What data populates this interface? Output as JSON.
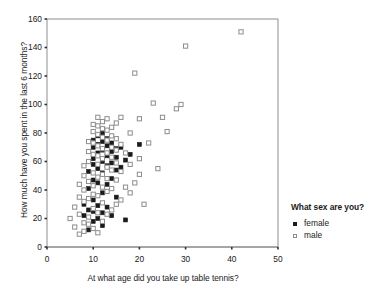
{
  "chart_data": {
    "type": "scatter",
    "title": "",
    "xlabel": "At what age did you take up table tennis?",
    "ylabel": "How much have you spent in the last 6 months?",
    "xlim": [
      0,
      50
    ],
    "ylim": [
      0,
      160
    ],
    "xticks": [
      0,
      10,
      20,
      30,
      40,
      50
    ],
    "yticks": [
      0,
      20,
      40,
      60,
      80,
      100,
      120,
      140,
      160
    ],
    "grid": false,
    "legend": {
      "title": "What sex are you?",
      "position": "right",
      "entries": [
        {
          "label": "female",
          "marker": "filled-square",
          "color": "#1a1a1a"
        },
        {
          "label": "male",
          "marker": "open-square",
          "color": "#8d8d8d"
        }
      ]
    },
    "series": [
      {
        "name": "female",
        "marker": "filled-square",
        "color": "#1a1a1a",
        "points": [
          [
            8,
            22
          ],
          [
            8,
            30
          ],
          [
            9,
            12
          ],
          [
            9,
            26
          ],
          [
            9,
            41
          ],
          [
            9,
            53
          ],
          [
            10,
            18
          ],
          [
            10,
            25
          ],
          [
            10,
            33
          ],
          [
            10,
            47
          ],
          [
            10,
            58
          ],
          [
            10,
            62
          ],
          [
            10,
            70
          ],
          [
            10,
            75
          ],
          [
            11,
            20
          ],
          [
            11,
            29
          ],
          [
            11,
            45
          ],
          [
            11,
            55
          ],
          [
            11,
            66
          ],
          [
            11,
            72
          ],
          [
            11,
            78
          ],
          [
            12,
            15
          ],
          [
            12,
            24
          ],
          [
            12,
            38
          ],
          [
            12,
            52
          ],
          [
            12,
            60
          ],
          [
            12,
            68
          ],
          [
            12,
            74
          ],
          [
            12,
            80
          ],
          [
            13,
            28
          ],
          [
            13,
            44
          ],
          [
            13,
            57
          ],
          [
            13,
            64
          ],
          [
            13,
            71
          ],
          [
            13,
            76
          ],
          [
            14,
            22
          ],
          [
            14,
            48
          ],
          [
            14,
            59
          ],
          [
            14,
            67
          ],
          [
            14,
            73
          ],
          [
            15,
            35
          ],
          [
            15,
            54
          ],
          [
            15,
            63
          ],
          [
            15,
            69
          ],
          [
            16,
            56
          ],
          [
            16,
            70
          ],
          [
            17,
            19
          ],
          [
            17,
            61
          ],
          [
            18,
            65
          ],
          [
            20,
            72
          ]
        ]
      },
      {
        "name": "male",
        "marker": "open-square",
        "color": "#8d8d8d",
        "points": [
          [
            5,
            20
          ],
          [
            6,
            14
          ],
          [
            6,
            28
          ],
          [
            7,
            9
          ],
          [
            7,
            23
          ],
          [
            7,
            35
          ],
          [
            7,
            44
          ],
          [
            8,
            11
          ],
          [
            8,
            17
          ],
          [
            8,
            32
          ],
          [
            8,
            40
          ],
          [
            8,
            50
          ],
          [
            8,
            57
          ],
          [
            9,
            16
          ],
          [
            9,
            21
          ],
          [
            9,
            34
          ],
          [
            9,
            46
          ],
          [
            9,
            60
          ],
          [
            9,
            67
          ],
          [
            9,
            74
          ],
          [
            10,
            13
          ],
          [
            10,
            27
          ],
          [
            10,
            37
          ],
          [
            10,
            43
          ],
          [
            10,
            52
          ],
          [
            10,
            65
          ],
          [
            10,
            73
          ],
          [
            10,
            81
          ],
          [
            10,
            86
          ],
          [
            11,
            10
          ],
          [
            11,
            24
          ],
          [
            11,
            36
          ],
          [
            11,
            49
          ],
          [
            11,
            58
          ],
          [
            11,
            64
          ],
          [
            11,
            71
          ],
          [
            11,
            79
          ],
          [
            11,
            85
          ],
          [
            11,
            91
          ],
          [
            12,
            18
          ],
          [
            12,
            31
          ],
          [
            12,
            42
          ],
          [
            12,
            51
          ],
          [
            12,
            62
          ],
          [
            12,
            69
          ],
          [
            12,
            77
          ],
          [
            12,
            83
          ],
          [
            12,
            88
          ],
          [
            13,
            23
          ],
          [
            13,
            39
          ],
          [
            13,
            48
          ],
          [
            13,
            56
          ],
          [
            13,
            66
          ],
          [
            13,
            75
          ],
          [
            13,
            82
          ],
          [
            13,
            90
          ],
          [
            14,
            26
          ],
          [
            14,
            41
          ],
          [
            14,
            54
          ],
          [
            14,
            63
          ],
          [
            14,
            70
          ],
          [
            14,
            78
          ],
          [
            14,
            84
          ],
          [
            15,
            30
          ],
          [
            15,
            47
          ],
          [
            15,
            59
          ],
          [
            15,
            68
          ],
          [
            15,
            76
          ],
          [
            15,
            87
          ],
          [
            16,
            33
          ],
          [
            16,
            53
          ],
          [
            16,
            72
          ],
          [
            16,
            91
          ],
          [
            17,
            42
          ],
          [
            17,
            66
          ],
          [
            18,
            38
          ],
          [
            18,
            58
          ],
          [
            18,
            80
          ],
          [
            19,
            45
          ],
          [
            19,
            122
          ],
          [
            20,
            51
          ],
          [
            20,
            62
          ],
          [
            20,
            90
          ],
          [
            21,
            30
          ],
          [
            22,
            73
          ],
          [
            23,
            101
          ],
          [
            24,
            55
          ],
          [
            25,
            91
          ],
          [
            26,
            81
          ],
          [
            28,
            97
          ],
          [
            29,
            100
          ],
          [
            30,
            141
          ],
          [
            42,
            151
          ]
        ]
      }
    ]
  },
  "axes": {
    "x_tick_labels": [
      "0",
      "10",
      "20",
      "30",
      "40",
      "50"
    ],
    "y_tick_labels": [
      "0",
      "20",
      "40",
      "60",
      "80",
      "100",
      "120",
      "140",
      "160"
    ]
  }
}
